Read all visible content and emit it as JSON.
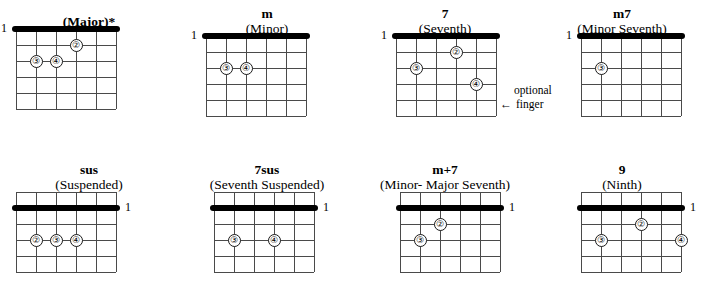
{
  "page": {
    "ink_color": "#000000",
    "grid_color": "#4a4a4a"
  },
  "grid_spec": {
    "strings": 6,
    "frets": 5,
    "string_label_top": "1",
    "string_label_bottom": "1"
  },
  "annotation": {
    "line1": "optional",
    "arrow": "←",
    "line2": "finger"
  },
  "chords": [
    {
      "id": "major",
      "title": "(Major)*",
      "subtitle": "",
      "nut_row": 0,
      "label_side": "left",
      "label": "1",
      "fingers": [
        {
          "num": "②",
          "string": 4,
          "fret": 1
        },
        {
          "num": "③",
          "string": 2,
          "fret": 2
        },
        {
          "num": "④",
          "string": 3,
          "fret": 2
        }
      ]
    },
    {
      "id": "minor",
      "title": "m",
      "subtitle": "(Minor)",
      "nut_row": 0,
      "label_side": "left",
      "label": "1",
      "fingers": [
        {
          "num": "③",
          "string": 2,
          "fret": 2
        },
        {
          "num": "④",
          "string": 3,
          "fret": 2
        }
      ]
    },
    {
      "id": "seventh",
      "title": "7",
      "subtitle": "(Seventh)",
      "nut_row": 0,
      "label_side": "left",
      "label": "1",
      "fingers": [
        {
          "num": "②",
          "string": 4,
          "fret": 1
        },
        {
          "num": "③",
          "string": 2,
          "fret": 2
        },
        {
          "num": "④",
          "string": 5,
          "fret": 3
        }
      ]
    },
    {
      "id": "minor-seventh",
      "title": "m7",
      "subtitle": "(Minor Seventh)",
      "nut_row": 0,
      "label_side": "left",
      "label": "1",
      "fingers": [
        {
          "num": "③",
          "string": 2,
          "fret": 2
        }
      ]
    },
    {
      "id": "sus",
      "title": "sus",
      "subtitle": "(Suspended)",
      "nut_row": 1,
      "label_side": "right",
      "label": "1",
      "fingers": [
        {
          "num": "②",
          "string": 2,
          "fret": 3
        },
        {
          "num": "③",
          "string": 3,
          "fret": 3
        },
        {
          "num": "④",
          "string": 4,
          "fret": 3
        }
      ]
    },
    {
      "id": "seventh-suspended",
      "title": "7sus",
      "subtitle": "(Seventh Suspended)",
      "nut_row": 1,
      "label_side": "right",
      "label": "1",
      "fingers": [
        {
          "num": "③",
          "string": 2,
          "fret": 3
        },
        {
          "num": "④",
          "string": 4,
          "fret": 3
        }
      ]
    },
    {
      "id": "minor-major-seventh",
      "title": "m+7",
      "subtitle": "(Minor- Major Seventh)",
      "nut_row": 1,
      "label_side": "right",
      "label": "1",
      "fingers": [
        {
          "num": "②",
          "string": 3,
          "fret": 2
        },
        {
          "num": "③",
          "string": 2,
          "fret": 3
        }
      ]
    },
    {
      "id": "ninth",
      "title": "9",
      "subtitle": "(Ninth)",
      "nut_row": 1,
      "label_side": "right",
      "label": "1",
      "fingers": [
        {
          "num": "②",
          "string": 4,
          "fret": 2
        },
        {
          "num": "③",
          "string": 2,
          "fret": 3
        },
        {
          "num": "④",
          "string": 6,
          "fret": 3
        }
      ]
    }
  ],
  "layout": {
    "cells": [
      {
        "left": 0,
        "top": 14,
        "board_left": 16
      },
      {
        "left": 178,
        "top": 6,
        "board_left": 28
      },
      {
        "left": 356,
        "top": 6,
        "board_left": 40
      },
      {
        "left": 533,
        "top": 6,
        "board_left": 48
      },
      {
        "left": 0,
        "top": 162,
        "board_left": 16
      },
      {
        "left": 178,
        "top": 162,
        "board_left": 36
      },
      {
        "left": 356,
        "top": 162,
        "board_left": 44
      },
      {
        "left": 533,
        "top": 162,
        "board_left": 48
      }
    ],
    "annotation_pos": {
      "left": 500,
      "top": 83
    }
  }
}
